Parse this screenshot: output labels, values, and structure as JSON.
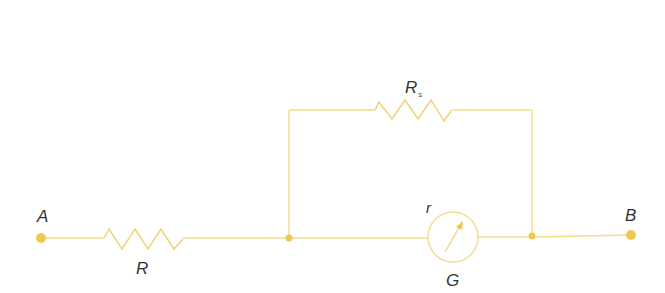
{
  "diagram": {
    "type": "circuit",
    "colors": {
      "wire": "#f3dc8c",
      "node": "#f0c850",
      "label": "#333333",
      "background": "#ffffff"
    },
    "terminals": [
      {
        "id": "A",
        "label": "A"
      },
      {
        "id": "B",
        "label": "B"
      }
    ],
    "components": [
      {
        "id": "R",
        "kind": "resistor",
        "label": "R",
        "position": "series, between A and junction"
      },
      {
        "id": "Rs",
        "kind": "resistor",
        "label": "R",
        "subscript": "s",
        "position": "shunt branch (parallel to galvanometer)"
      },
      {
        "id": "G",
        "kind": "galvanometer",
        "label": "G",
        "internal_label": "r",
        "position": "lower branch"
      }
    ]
  }
}
